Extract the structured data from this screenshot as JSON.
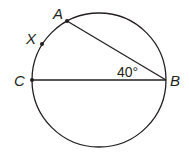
{
  "diagram": {
    "type": "circle-geometry",
    "circle": {
      "cx": 99,
      "cy": 80,
      "r": 67
    },
    "stroke_color": "#231f20",
    "points": {
      "A": {
        "label": "A",
        "x": 67,
        "y": 21
      },
      "X": {
        "label": "X",
        "x": 42,
        "y": 44
      },
      "C": {
        "label": "C",
        "x": 32,
        "y": 80
      },
      "B": {
        "label": "B",
        "x": 166,
        "y": 80
      }
    },
    "segments": [
      {
        "from": "A",
        "to": "B"
      },
      {
        "from": "C",
        "to": "B"
      }
    ],
    "angle": {
      "vertex": "B",
      "between": [
        "A",
        "C"
      ],
      "label": "40°"
    }
  }
}
